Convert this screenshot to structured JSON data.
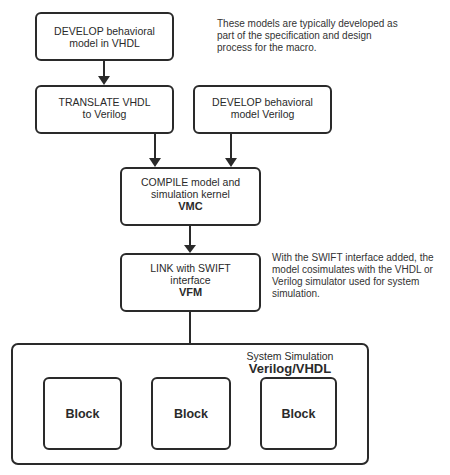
{
  "nodes": {
    "develop_vhdl": {
      "lines": [
        "DEVELOP behavioral",
        "model in VHDL"
      ]
    },
    "translate": {
      "lines": [
        "TRANSLATE VHDL",
        "to Verilog"
      ]
    },
    "develop_verilog": {
      "lines": [
        "DEVELOP behavioral",
        "model Verilog"
      ]
    },
    "compile": {
      "lines": [
        "COMPILE model and",
        "simulation kernel"
      ],
      "tag": "VMC"
    },
    "link": {
      "lines": [
        "LINK with SWIFT",
        "interface"
      ],
      "tag": "VFM"
    }
  },
  "notes": {
    "top": [
      "These models are typically developed as",
      "part of the specification and design",
      "process for the macro."
    ],
    "middle": [
      "With the SWIFT interface added, the",
      "model cosimulates with the VHDL or",
      "Verilog simulator used for system",
      "simulation."
    ]
  },
  "system": {
    "title": "System Simulation",
    "subtitle": "Verilog/VHDL",
    "blocks": [
      "Block",
      "Block",
      "Block"
    ]
  },
  "edges": [
    {
      "from": "develop_vhdl",
      "to": "translate"
    },
    {
      "from": "translate",
      "to": "compile"
    },
    {
      "from": "develop_verilog",
      "to": "compile"
    },
    {
      "from": "compile",
      "to": "link"
    },
    {
      "from": "link",
      "to": "system.blocks.1"
    }
  ]
}
